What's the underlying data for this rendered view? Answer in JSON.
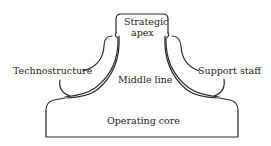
{
  "diagram": {
    "parts": {
      "strategic_apex": {
        "line1": "Strategic",
        "line2": "apex"
      },
      "technostructure": "Technostructure",
      "support_staff": "Support staff",
      "middle_line": "Middle line",
      "operating_core": "Operating core"
    },
    "colors": {
      "stroke": "#2a2a2a",
      "background": "#ffffff",
      "text": "#222222"
    }
  }
}
